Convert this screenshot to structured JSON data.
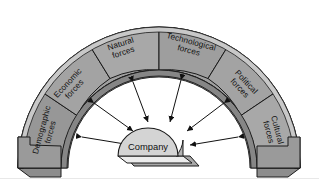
{
  "diagram": {
    "type": "radial-arc-diagram",
    "center": {
      "label": "Company",
      "shape": "dome",
      "fill": "#d4d4d4",
      "base_fill": "#ebebeb",
      "base_side_fill": "#a8a8a8"
    },
    "arc": {
      "fill": "#a0a0a0",
      "top_edge_fill": "#c6c6c6",
      "inner_wall_fill": "#8a8a8a",
      "end_face_fill": "#9a9a9a",
      "stroke": "#1a1a1a"
    },
    "segments": [
      {
        "id": "demographic",
        "label_line1": "Demographic",
        "label_line2": "forces",
        "fill": "#979797"
      },
      {
        "id": "economic",
        "label_line1": "Economic",
        "label_line2": "forces",
        "fill": "#a3a3a3"
      },
      {
        "id": "natural",
        "label_line1": "Natural",
        "label_line2": "forces",
        "fill": "#a8a8a8"
      },
      {
        "id": "technological",
        "label_line1": "Technological",
        "label_line2": "forces",
        "fill": "#9e9e9e"
      },
      {
        "id": "political",
        "label_line1": "Political",
        "label_line2": "forces",
        "fill": "#a3a3a3"
      },
      {
        "id": "cultural",
        "label_line1": "Cultural",
        "label_line2": "forces",
        "fill": "#a8a8a8"
      }
    ],
    "arrows": {
      "count": 6,
      "style": "double-headed",
      "color": "#111111",
      "description": "Double-headed arrows radiate between the central company and each of the six force segments."
    }
  }
}
